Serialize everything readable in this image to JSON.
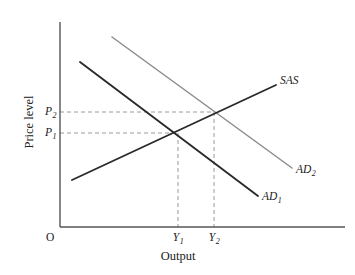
{
  "figure": {
    "kind": "economics-ad-sas-diagram",
    "background_color": "#ffffff"
  },
  "axes": {
    "y_axis": {
      "label": "Price level",
      "name": "price-level-axis",
      "color": "#555555",
      "x_px": 60,
      "top_px": 22,
      "bottom_px": 227
    },
    "x_axis": {
      "label": "Output",
      "name": "output-axis",
      "color": "#555555",
      "y_px": 227,
      "left_px": 60,
      "right_px": 345
    },
    "origin_label": "O"
  },
  "tick_labels": {
    "price": [
      {
        "id": "P2",
        "base": "P",
        "sub": "2",
        "y_px": 112
      },
      {
        "id": "P1",
        "base": "P",
        "sub": "1",
        "y_px": 133
      }
    ],
    "output": [
      {
        "id": "Y1",
        "base": "Y",
        "sub": "1",
        "x_px": 178
      },
      {
        "id": "Y2",
        "base": "Y",
        "sub": "2",
        "x_px": 214
      }
    ]
  },
  "curves": [
    {
      "id": "SAS",
      "label_base": "SAS",
      "label_sub": "",
      "description": "short-run aggregate supply, upward sloping",
      "color": "#2a2a2a",
      "width": 1.9,
      "x1": 72,
      "y1": 180,
      "x2": 276,
      "y2": 85,
      "label_x": 280,
      "label_y": 81
    },
    {
      "id": "AD1",
      "label_base": "AD",
      "label_sub": "1",
      "description": "initial aggregate demand, downward sloping",
      "color": "#2a2a2a",
      "width": 1.9,
      "x1": 80,
      "y1": 62,
      "x2": 258,
      "y2": 196,
      "label_x": 262,
      "label_y": 197
    },
    {
      "id": "AD2",
      "label_base": "AD",
      "label_sub": "2",
      "description": "shifted aggregate demand, downward sloping",
      "color": "#8c8c8c",
      "width": 1.5,
      "x1": 112,
      "y1": 37,
      "x2": 292,
      "y2": 168,
      "label_x": 296,
      "label_y": 170
    }
  ],
  "equilibria": [
    {
      "id": "E1",
      "x_px": 178,
      "y_px": 133,
      "price": "P1",
      "output": "Y1"
    },
    {
      "id": "E2",
      "x_px": 214,
      "y_px": 112,
      "price": "P2",
      "output": "Y2"
    }
  ],
  "guide_lines": {
    "color": "#9a9a9a",
    "dash": "4,3",
    "items": [
      {
        "id": "p1-horizontal",
        "x1": 60,
        "y1": 133,
        "x2": 178,
        "y2": 133
      },
      {
        "id": "p2-horizontal",
        "x1": 60,
        "y1": 112,
        "x2": 214,
        "y2": 112
      },
      {
        "id": "y1-vertical",
        "x1": 178,
        "y1": 133,
        "x2": 178,
        "y2": 227
      },
      {
        "id": "y2-vertical",
        "x1": 214,
        "y1": 112,
        "x2": 214,
        "y2": 227
      }
    ]
  },
  "chart_data": {
    "type": "line",
    "title": "",
    "xlabel": "Output",
    "ylabel": "Price level",
    "grid": false,
    "legend_position": "inline-curve-labels",
    "annotations": [
      "SAS",
      "AD₁",
      "AD₂",
      "P₁",
      "P₂",
      "Y₁",
      "Y₂",
      "O"
    ],
    "series": [
      {
        "name": "SAS",
        "points": [
          [
            72,
            180
          ],
          [
            276,
            85
          ]
        ],
        "color": "#2a2a2a"
      },
      {
        "name": "AD1",
        "points": [
          [
            80,
            62
          ],
          [
            258,
            196
          ]
        ],
        "color": "#2a2a2a"
      },
      {
        "name": "AD2",
        "points": [
          [
            112,
            37
          ],
          [
            292,
            168
          ]
        ],
        "color": "#8c8c8c"
      }
    ],
    "intersections": [
      {
        "label": "P1,Y1",
        "x": 178,
        "y": 133
      },
      {
        "label": "P2,Y2",
        "x": 214,
        "y": 112
      }
    ]
  }
}
